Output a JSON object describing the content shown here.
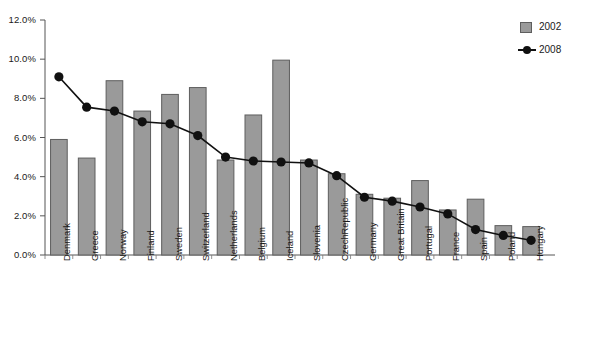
{
  "chart_data": {
    "type": "bar",
    "title": "",
    "subtitle": "",
    "xlabel": "",
    "ylabel": "",
    "ylim": [
      0,
      12
    ],
    "ytick_labels": [
      "12.0%",
      "10.0%",
      "8.0%",
      "6.0%",
      "4.0%",
      "2.0%",
      "0.0%"
    ],
    "ytick_values": [
      12,
      10,
      8,
      6,
      4,
      2,
      0
    ],
    "grid": false,
    "legend_position": "top-right",
    "categories": [
      "Denmark",
      "Greece",
      "Norway",
      "Finland",
      "Sweden",
      "Switzerland",
      "Netherlands",
      "Belgium",
      "Iceland",
      "Slovenia",
      "CzechRepublic",
      "Germany",
      "Great Britain",
      "Portugal",
      "France",
      "Spain",
      "Poland",
      "Hungary"
    ],
    "series": [
      {
        "name": "2002",
        "render": "bar",
        "color": "#9a9a9a",
        "edge_color": "#5e5e5e",
        "values": [
          5.9,
          4.95,
          8.9,
          7.35,
          8.2,
          8.55,
          4.85,
          7.15,
          9.95,
          4.85,
          4.15,
          3.1,
          2.9,
          3.8,
          2.3,
          2.85,
          1.5,
          1.45
        ]
      },
      {
        "name": "2008",
        "render": "line",
        "color": "#111111",
        "marker": "circle",
        "values": [
          9.1,
          7.55,
          7.35,
          6.8,
          6.7,
          6.1,
          5.0,
          4.8,
          4.75,
          4.7,
          4.05,
          2.95,
          2.75,
          2.45,
          2.1,
          1.3,
          1.0,
          0.75
        ]
      }
    ]
  },
  "legend": {
    "items": [
      {
        "label": "2002",
        "type": "swatch"
      },
      {
        "label": "2008",
        "type": "line-marker"
      }
    ]
  }
}
